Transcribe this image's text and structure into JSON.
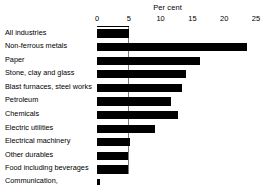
{
  "chart_data": {
    "type": "bar",
    "orientation": "horizontal",
    "title": "Per cent",
    "xlabel": "Per cent",
    "ylabel": "",
    "xlim": [
      0,
      25
    ],
    "xticks": [
      0,
      5,
      10,
      15,
      20,
      25
    ],
    "xtick_labels": [
      "0",
      "5",
      "10",
      "15",
      "20",
      "25"
    ],
    "grid": false,
    "reference_line": 5,
    "bar_color": "#000000",
    "categories": [
      "All industries",
      "Non-ferrous metals",
      "Paper",
      "Stone, clay and glass",
      "Blast furnaces, steel works",
      "Petroleum",
      "Chemicals",
      "Electric utilities",
      "Electrical machinery",
      "Other durables",
      "Food including beverages",
      "Communication, commercial and other"
    ],
    "values": [
      5.0,
      23.6,
      16.2,
      14.0,
      13.4,
      11.6,
      12.7,
      9.1,
      5.2,
      4.9,
      4.9,
      0.4
    ],
    "rows": [
      {
        "label": "All industries",
        "value": 5.0
      },
      {
        "label": "Non-ferrous metals",
        "value": 23.6
      },
      {
        "label": "Paper",
        "value": 16.2
      },
      {
        "label": "Stone, clay and glass",
        "value": 14.0
      },
      {
        "label": "Blast furnaces, steel works",
        "value": 13.4
      },
      {
        "label": "Petroleum",
        "value": 11.6
      },
      {
        "label": "Chemicals",
        "value": 12.7
      },
      {
        "label": "Electric utilities",
        "value": 9.1
      },
      {
        "label": "Electrical machinery",
        "value": 5.2
      },
      {
        "label": "Other durables",
        "value": 4.9
      },
      {
        "label": "Food including beverages",
        "value": 4.9
      },
      {
        "label": "Communication, commercial and other",
        "value": 0.4
      }
    ]
  }
}
